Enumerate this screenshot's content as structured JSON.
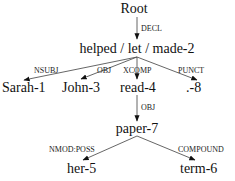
{
  "diagram": {
    "type": "dependency-tree",
    "nodes": {
      "root": {
        "text": "Root"
      },
      "n2": {
        "text": "helped / let / made-2"
      },
      "n1": {
        "text": "Sarah-1"
      },
      "n3": {
        "text": "John-3"
      },
      "n4": {
        "text": "read-4"
      },
      "n8": {
        "text": ".-8"
      },
      "n7": {
        "text": "paper-7"
      },
      "n5": {
        "text": "her-5"
      },
      "n6": {
        "text": "term-6"
      }
    },
    "edges": {
      "decl": {
        "from": "Root",
        "to": "helped / let / made-2",
        "label": "DECL"
      },
      "nsubj": {
        "from": "helped / let / made-2",
        "to": "Sarah-1",
        "label": "NSUBJ"
      },
      "obj1": {
        "from": "helped / let / made-2",
        "to": "John-3",
        "label": "OBJ"
      },
      "xcomp": {
        "from": "helped / let / made-2",
        "to": "read-4",
        "label": "XCOMP"
      },
      "punct": {
        "from": "helped / let / made-2",
        "to": ".-8",
        "label": "PUNCT"
      },
      "obj2": {
        "from": "read-4",
        "to": "paper-7",
        "label": "OBJ"
      },
      "nmodposs": {
        "from": "paper-7",
        "to": "her-5",
        "label": "NMOD:POSS"
      },
      "compound": {
        "from": "paper-7",
        "to": "term-6",
        "label": "COMPOUND"
      }
    },
    "colors": {
      "edge": "#555555",
      "text": "#111111",
      "background": "#ffffff"
    }
  }
}
